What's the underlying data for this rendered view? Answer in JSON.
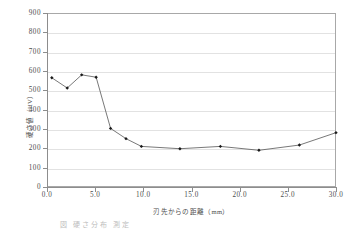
{
  "figure": {
    "y_axis_title": "硬さ値（HV）",
    "x_axis_title": "刃先からの距離（mm）",
    "caption_fragment": "図  硬さ分布  測定"
  },
  "chart_data": {
    "type": "line",
    "title": "",
    "xlabel": "刃先からの距離（mm）",
    "ylabel": "硬さ値（HV）",
    "xlim": [
      0.0,
      30.0
    ],
    "ylim": [
      0,
      900
    ],
    "xticks": [
      "0.0",
      "5.0",
      "10.0",
      "15.0",
      "20.0",
      "25.0",
      "30.0"
    ],
    "xtick_values": [
      0.0,
      5.0,
      10.0,
      15.0,
      20.0,
      25.0,
      30.0
    ],
    "yticks": [
      "0",
      "100",
      "200",
      "300",
      "400",
      "500",
      "600",
      "700",
      "800",
      "900"
    ],
    "ytick_values": [
      0,
      100,
      200,
      300,
      400,
      500,
      600,
      700,
      800,
      900
    ],
    "grid": "horizontal",
    "legend": "none",
    "marker": "filled-diamond",
    "line_color": "#555555",
    "marker_color": "#1a1a1a",
    "series": [
      {
        "name": "硬さ値",
        "x": [
          0.5,
          2.1,
          3.6,
          5.1,
          6.6,
          8.2,
          9.8,
          13.8,
          18.0,
          22.0,
          26.2,
          30.0
        ],
        "y": [
          565,
          512,
          580,
          568,
          303,
          250,
          210,
          198,
          210,
          190,
          217,
          281
        ]
      }
    ]
  }
}
